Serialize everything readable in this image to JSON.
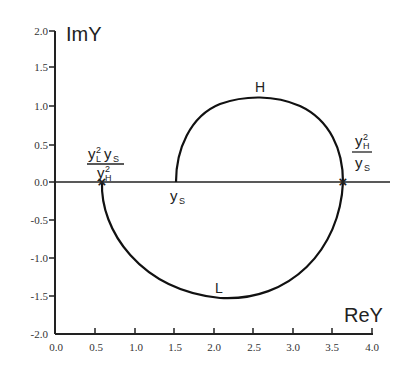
{
  "diagram": {
    "y_axis_title": "ImY",
    "x_axis_title": "ReY",
    "y_ticks": [
      "2.0",
      "1.5",
      "1.0",
      "0.5",
      "0.0",
      "-0.5",
      "-1.0",
      "-1.5",
      "-2.0"
    ],
    "x_ticks": [
      "0.0",
      "0.5",
      "1.0",
      "1.5",
      "2.0",
      "2.5",
      "3.0",
      "3.5",
      "4.0"
    ],
    "arc_labels": {
      "upper": "H",
      "lower": "L"
    },
    "points": {
      "left_marker": {
        "re": 0.6,
        "im": 0.0,
        "numerator_base1": "y",
        "numerator_sup1": "2",
        "numerator_sub1": "L",
        "numerator_base2": "y",
        "numerator_sub2": "S",
        "denominator_base": "y",
        "denominator_sup": "2",
        "denominator_sub": "H"
      },
      "start": {
        "re": 1.53,
        "im": 0.0,
        "base": "y",
        "sub": "S"
      },
      "right_marker": {
        "re": 3.65,
        "im": 0.0,
        "numerator_base": "y",
        "numerator_sup": "2",
        "numerator_sub": "H",
        "denominator_base": "y",
        "denominator_sub": "S"
      }
    },
    "arc_extrema": {
      "H_peak_im": 1.07,
      "H_peak_re": 2.6,
      "L_min_im": -1.53,
      "L_min_re": 2.15
    },
    "marker_symbol": "×"
  }
}
